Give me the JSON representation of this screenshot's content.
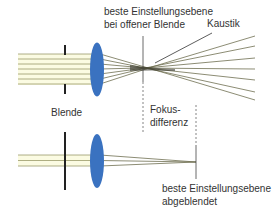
{
  "diagram": {
    "top": {
      "focus_label_line1": "beste Einstellungsebene",
      "focus_label_line2": "bei offener Blende",
      "caustic_label": "Kaustik",
      "aperture_label": "Blende"
    },
    "middle": {
      "focus_difference_line1": "Fokus-",
      "focus_difference_line2": "differenz"
    },
    "bottom": {
      "focus_label_line1": "beste Einstellungsebene",
      "focus_label_line2": "abgeblendet"
    },
    "colors": {
      "lens": "#3a72c0",
      "rays": "#9a9a6a",
      "ray_fill": "#fbfbe2",
      "aperture": "#222222",
      "text": "#333333"
    }
  }
}
